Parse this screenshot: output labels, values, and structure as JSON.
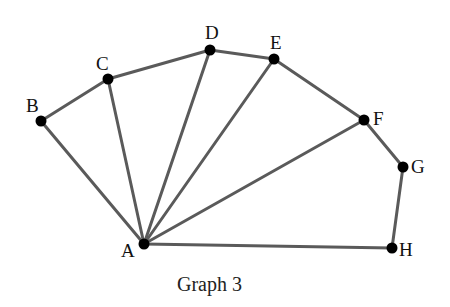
{
  "graph": {
    "caption": "Graph 3",
    "edge_color": "#5a5a5a",
    "node_color": "#000000",
    "nodes": [
      {
        "id": "A",
        "x": 144,
        "y": 244,
        "lx": 121,
        "ly": 257
      },
      {
        "id": "B",
        "x": 41,
        "y": 121,
        "lx": 26,
        "ly": 112
      },
      {
        "id": "C",
        "x": 108,
        "y": 79,
        "lx": 96,
        "ly": 70
      },
      {
        "id": "D",
        "x": 210,
        "y": 50,
        "lx": 205,
        "ly": 39
      },
      {
        "id": "E",
        "x": 274,
        "y": 59,
        "lx": 270,
        "ly": 49
      },
      {
        "id": "F",
        "x": 364,
        "y": 120,
        "lx": 373,
        "ly": 125
      },
      {
        "id": "G",
        "x": 403,
        "y": 167,
        "lx": 411,
        "ly": 173
      },
      {
        "id": "H",
        "x": 392,
        "y": 248,
        "lx": 399,
        "ly": 256
      }
    ],
    "edges": [
      [
        "A",
        "B"
      ],
      [
        "A",
        "C"
      ],
      [
        "A",
        "D"
      ],
      [
        "A",
        "E"
      ],
      [
        "A",
        "F"
      ],
      [
        "A",
        "H"
      ],
      [
        "B",
        "C"
      ],
      [
        "C",
        "D"
      ],
      [
        "D",
        "E"
      ],
      [
        "E",
        "F"
      ],
      [
        "F",
        "G"
      ],
      [
        "G",
        "H"
      ]
    ]
  }
}
